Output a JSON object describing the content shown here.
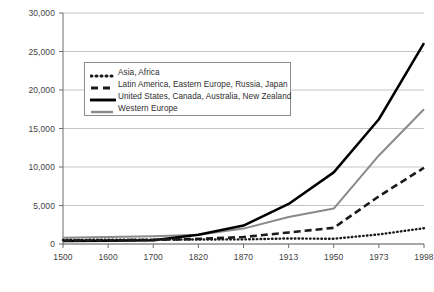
{
  "chart_data": {
    "type": "line",
    "title": "",
    "xlabel": "",
    "ylabel": "US$",
    "x": [
      "1500",
      "1600",
      "1700",
      "1820",
      "1870",
      "1913",
      "1950",
      "1973",
      "1998"
    ],
    "xtick_labels": [
      "1500",
      "1600",
      "1700",
      "1820",
      "1870",
      "1913",
      "1950",
      "1973",
      "1998"
    ],
    "ytick_labels": [
      "0",
      "5,000",
      "10,000",
      "15,000",
      "20,000",
      "25,000",
      "30,000"
    ],
    "ytick_values": [
      0,
      5000,
      10000,
      15000,
      20000,
      25000,
      30000
    ],
    "ylim": [
      0,
      30000
    ],
    "grid": "horizontal",
    "legend_position": "upper-left-inside",
    "series": [
      {
        "name": "Asia, Africa",
        "style": "dotted",
        "color": "#1a1a1a",
        "values": [
          520,
          560,
          570,
          590,
          600,
          720,
          680,
          1250,
          2050
        ]
      },
      {
        "name": "Latin America, Eastern Europe, Russia, Japan",
        "style": "dashed",
        "color": "#1a1a1a",
        "values": [
          430,
          470,
          530,
          660,
          900,
          1500,
          2100,
          6200,
          9900
        ]
      },
      {
        "name": "United States, Canada, Australia, New Zealand",
        "style": "solid-thick",
        "color": "#000000",
        "values": [
          400,
          430,
          480,
          1200,
          2400,
          5200,
          9300,
          16200,
          26100
        ]
      },
      {
        "name": "Western Europe",
        "style": "solid-thin",
        "color": "#8a8a8a",
        "values": [
          800,
          900,
          1000,
          1200,
          2000,
          3500,
          4600,
          11500,
          17500
        ]
      }
    ]
  },
  "axis": {
    "y_title": "US$"
  },
  "legend": {
    "items": [
      {
        "label": "Asia, Africa",
        "swatch": "dotted-line-swatch"
      },
      {
        "label": "Latin America, Eastern Europe, Russia, Japan",
        "swatch": "dashed-line-swatch"
      },
      {
        "label": "United States, Canada, Australia, New Zealand",
        "swatch": "solid-thick-line-swatch"
      },
      {
        "label": "Western Europe",
        "swatch": "solid-thin-gray-line-swatch"
      }
    ]
  },
  "caption": {
    "text": ""
  }
}
